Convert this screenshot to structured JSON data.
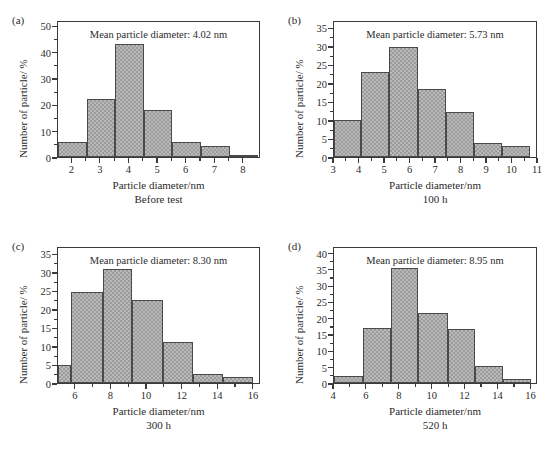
{
  "figure": {
    "background": "#ffffff",
    "bar_fill": "#b9b9b9",
    "bar_pattern": "#9c9c9c",
    "bar_edge": "#4a4a4a",
    "axis_color": "#3a3a3a"
  },
  "chart_data": [
    {
      "type": "bar",
      "panel": "(a)",
      "title": "Mean particle diameter: 4.02 nm",
      "mean_diameter_nm": 4.02,
      "xlabel": "Particle diameter/nm",
      "ylabel": "Number of particle/ %",
      "caption": "Before test",
      "xlim": [
        1.5,
        8.6
      ],
      "ylim": [
        0,
        52
      ],
      "xticks": [
        2,
        3,
        4,
        5,
        6,
        7,
        8
      ],
      "yticks": [
        0,
        10,
        20,
        30,
        40,
        50
      ],
      "yminor_step": 5,
      "grid": false,
      "legend": "none",
      "bin_edges": [
        1.5,
        2.5,
        3.5,
        4.5,
        5.5,
        6.5,
        7.5,
        8.5
      ],
      "values": [
        5.7,
        22.1,
        43.0,
        17.8,
        5.6,
        4.0,
        0.5
      ]
    },
    {
      "type": "bar",
      "panel": "(b)",
      "title": "Mean particle diameter: 5.73 nm",
      "mean_diameter_nm": 5.73,
      "xlabel": "Particle diameter/nm",
      "ylabel": "Number of particle/ %",
      "caption": "100 h",
      "xlim": [
        3,
        11
      ],
      "ylim": [
        0,
        37
      ],
      "xticks": [
        3,
        4,
        5,
        6,
        7,
        8,
        9,
        10,
        11
      ],
      "yticks": [
        0,
        5,
        10,
        15,
        20,
        25,
        30,
        35
      ],
      "yminor_step": 2.5,
      "grid": false,
      "legend": "none",
      "bin_edges": [
        3.0,
        4.05,
        5.15,
        6.3,
        7.4,
        8.5,
        9.6,
        10.7
      ],
      "values": [
        10.0,
        22.9,
        29.8,
        18.3,
        12.2,
        3.7,
        2.9
      ]
    },
    {
      "type": "bar",
      "panel": "(c)",
      "title": "Mean particle diameter: 8.30 nm",
      "mean_diameter_nm": 8.3,
      "xlabel": "Particle diameter/nm",
      "ylabel": "Number of particle/ %",
      "caption": "300 h",
      "xlim": [
        5,
        16.4
      ],
      "ylim": [
        0,
        37
      ],
      "xticks": [
        6,
        8,
        10,
        12,
        14,
        16
      ],
      "yticks": [
        0,
        5,
        10,
        15,
        20,
        25,
        30,
        35
      ],
      "yminor_step": 2.5,
      "grid": false,
      "legend": "none",
      "bin_edges": [
        5.0,
        5.75,
        7.5,
        9.15,
        10.9,
        12.6,
        14.25,
        15.95
      ],
      "values": [
        5.0,
        24.7,
        30.7,
        22.5,
        11.1,
        2.4,
        1.6
      ]
    },
    {
      "type": "bar",
      "panel": "(d)",
      "title": "Mean particle diameter: 8.95 nm",
      "mean_diameter_nm": 8.95,
      "xlabel": "Particle diameter/nm",
      "ylabel": "Number of particle/ %",
      "caption": "520 h",
      "xlim": [
        4,
        16.4
      ],
      "ylim": [
        0,
        42
      ],
      "xticks": [
        4,
        6,
        8,
        10,
        12,
        14,
        16
      ],
      "yticks": [
        0,
        5,
        10,
        15,
        20,
        25,
        30,
        35,
        40
      ],
      "yminor_step": 2.5,
      "grid": false,
      "legend": "none",
      "bin_edges": [
        4.0,
        5.75,
        7.45,
        9.1,
        10.9,
        12.6,
        14.3,
        15.95
      ],
      "values": [
        2.1,
        16.8,
        35.2,
        21.4,
        16.6,
        5.2,
        1.1
      ]
    }
  ]
}
